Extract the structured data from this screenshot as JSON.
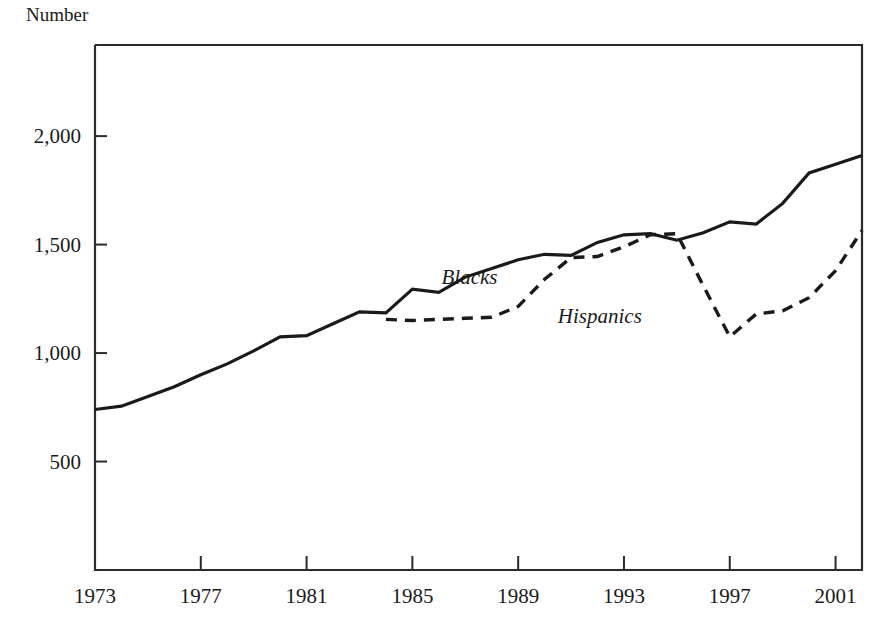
{
  "chart_data": {
    "type": "line",
    "title": "",
    "ylabel": "Number",
    "xlabel": "",
    "xlim": [
      1973,
      2002
    ],
    "ylim": [
      0,
      2420
    ],
    "grid": false,
    "legend_position": "inline-annotation",
    "y_ticks": [
      {
        "value": 500,
        "label": "500"
      },
      {
        "value": 1000,
        "label": "1,000"
      },
      {
        "value": 1500,
        "label": "1,500"
      },
      {
        "value": 2000,
        "label": "2,000"
      }
    ],
    "x_ticks": [
      {
        "value": 1973,
        "label": "1973"
      },
      {
        "value": 1977,
        "label": "1977"
      },
      {
        "value": 1981,
        "label": "1981"
      },
      {
        "value": 1985,
        "label": "1985"
      },
      {
        "value": 1989,
        "label": "1989"
      },
      {
        "value": 1993,
        "label": "1993"
      },
      {
        "value": 1997,
        "label": "1997"
      },
      {
        "value": 2001,
        "label": "2001"
      }
    ],
    "series": [
      {
        "name": "Blacks",
        "style": "solid",
        "color": "#1a1a1a",
        "label_x": 1986.1,
        "label_y": 1345,
        "x": [
          1973,
          1974,
          1975,
          1976,
          1977,
          1978,
          1979,
          1980,
          1981,
          1982,
          1983,
          1984,
          1985,
          1986,
          1987,
          1988,
          1989,
          1990,
          1991,
          1992,
          1993,
          1994,
          1995,
          1996,
          1997,
          1998,
          1999,
          2000,
          2001,
          2002
        ],
        "values": [
          740,
          755,
          800,
          845,
          900,
          950,
          1010,
          1075,
          1080,
          1135,
          1190,
          1185,
          1295,
          1280,
          1350,
          1390,
          1430,
          1455,
          1450,
          1510,
          1545,
          1550,
          1520,
          1555,
          1605,
          1595,
          1690,
          1830,
          1870,
          1910
        ],
        "note": "plotted 1973-2002 annual; peak 1910 at 1998, level ~1835 at 2000-2002"
      },
      {
        "name": "Hispanics",
        "style": "dashed",
        "color": "#1a1a1a",
        "label_x": 1990.5,
        "label_y": 1165,
        "x": [
          1984,
          1985,
          1986,
          1987,
          1988,
          1989,
          1990,
          1991,
          1992,
          1993,
          1994,
          1995,
          1996,
          1997,
          1998,
          1999,
          2000,
          2001,
          2002
        ],
        "values": [
          1155,
          1150,
          1155,
          1160,
          1165,
          1215,
          1340,
          1440,
          1445,
          1490,
          1545,
          1550,
          1310,
          1075,
          1180,
          1195,
          1255,
          1380,
          1565
        ],
        "note": "dashed series begins 1984, peaks 1550 in 1994-95, drops to 1075 in 1997, recovers to 1565 in 2002"
      }
    ]
  },
  "labels": {
    "y_axis_title": "Number",
    "series_blacks": "Blacks",
    "series_hispanics": "Hispanics"
  }
}
